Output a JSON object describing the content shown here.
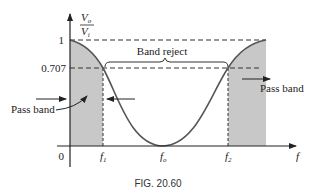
{
  "figure": {
    "caption": "FIG. 20.60",
    "type": "band-reject filter frequency response"
  },
  "axes": {
    "y_label_numerator": "V",
    "y_label_numerator_sub": "o",
    "y_label_denominator": "V",
    "y_label_denominator_sub": "i",
    "x_label": "f",
    "y_ticks": [
      "1",
      "0.707"
    ],
    "origin_label": "0",
    "x_ticks": [
      {
        "base": "f",
        "sub": "1"
      },
      {
        "base": "f",
        "sub": "o"
      },
      {
        "base": "f",
        "sub": "2"
      }
    ]
  },
  "annotations": {
    "band_reject": "Band reject",
    "pass_band_left": "Pass band",
    "pass_band_right": "Pass band"
  },
  "colors": {
    "shade": "#c8c8c8",
    "curve": "#555555",
    "axis": "#222222",
    "text": "#222222"
  }
}
